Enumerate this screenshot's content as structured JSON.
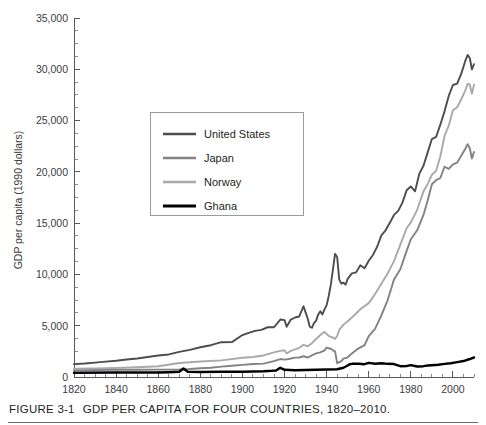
{
  "figure": {
    "caption_label": "FIGURE 3-1",
    "caption_title": "GDP PER CAPITA FOR FOUR COUNTRIES, 1820–2010."
  },
  "chart_data": {
    "type": "line",
    "title": "GDP PER CAPITA FOR FOUR COUNTRIES, 1820–2010.",
    "xlabel": "",
    "ylabel": "GDP per capita (1990 dollars)",
    "xlim": [
      1820,
      2010
    ],
    "ylim": [
      0,
      35000
    ],
    "grid": false,
    "legend_position": "upper-left-inside",
    "x_ticks": [
      1820,
      1840,
      1860,
      1880,
      1900,
      1920,
      1940,
      1960,
      1980,
      2000
    ],
    "x_tick_labels": [
      "1820",
      "1840",
      "1860",
      "1880",
      "1900",
      "1920",
      "1940",
      "1960",
      "1980",
      "2000"
    ],
    "x_minor_step": 5,
    "y_ticks": [
      0,
      5000,
      10000,
      15000,
      20000,
      25000,
      30000,
      35000
    ],
    "y_tick_labels": [
      "0",
      "5,000",
      "10,000",
      "15,000",
      "20,000",
      "25,000",
      "30,000",
      "35,000"
    ],
    "y_minor_step": 1250,
    "colors": {
      "united_states": "#4d4d4f",
      "japan": "#808285",
      "norway": "#a7a9ac",
      "ghana": "#000000"
    },
    "series": [
      {
        "name": "United States",
        "color": "#4d4d4f",
        "x": [
          1820,
          1825,
          1830,
          1835,
          1840,
          1845,
          1850,
          1855,
          1860,
          1865,
          1870,
          1875,
          1880,
          1885,
          1890,
          1895,
          1900,
          1903,
          1906,
          1909,
          1912,
          1915,
          1918,
          1920,
          1921,
          1923,
          1925,
          1927,
          1929,
          1930,
          1931,
          1932,
          1933,
          1934,
          1935,
          1936,
          1937,
          1938,
          1939,
          1940,
          1941,
          1942,
          1943,
          1944,
          1945,
          1946,
          1947,
          1948,
          1949,
          1950,
          1952,
          1954,
          1956,
          1958,
          1960,
          1962,
          1964,
          1966,
          1968,
          1970,
          1972,
          1974,
          1976,
          1978,
          1980,
          1982,
          1984,
          1986,
          1988,
          1990,
          1992,
          1994,
          1996,
          1998,
          2000,
          2002,
          2004,
          2006,
          2007,
          2008,
          2009,
          2010
        ],
        "y": [
          1257,
          1310,
          1400,
          1500,
          1588,
          1700,
          1806,
          1950,
          2100,
          2200,
          2445,
          2650,
          2900,
          3100,
          3392,
          3400,
          4091,
          4300,
          4500,
          4600,
          4850,
          4850,
          5600,
          5550,
          4900,
          5600,
          5800,
          5900,
          6899,
          6300,
          5700,
          4900,
          4800,
          5250,
          5500,
          6100,
          6400,
          6100,
          6600,
          7010,
          7900,
          9000,
          10500,
          12000,
          11700,
          9500,
          9100,
          9200,
          9000,
          9561,
          10100,
          10200,
          10900,
          10600,
          11328,
          11900,
          12700,
          13800,
          14300,
          15030,
          15800,
          16200,
          17000,
          18200,
          18577,
          18100,
          19800,
          20600,
          21900,
          23201,
          23400,
          24600,
          25900,
          27400,
          28467,
          28600,
          29600,
          30900,
          31400,
          31100,
          30000,
          30491
        ],
        "final_value": 30491
      },
      {
        "name": "Japan",
        "color": "#808285",
        "x": [
          1820,
          1830,
          1840,
          1850,
          1860,
          1870,
          1875,
          1880,
          1885,
          1890,
          1895,
          1900,
          1905,
          1910,
          1915,
          1918,
          1920,
          1922,
          1925,
          1927,
          1929,
          1931,
          1933,
          1935,
          1937,
          1939,
          1940,
          1941,
          1942,
          1943,
          1944,
          1945,
          1946,
          1947,
          1948,
          1950,
          1952,
          1955,
          1958,
          1960,
          1963,
          1966,
          1969,
          1972,
          1975,
          1978,
          1980,
          1983,
          1986,
          1988,
          1990,
          1992,
          1994,
          1996,
          1998,
          2000,
          2002,
          2004,
          2006,
          2007,
          2008,
          2009,
          2010
        ],
        "y": [
          669,
          680,
          690,
          704,
          720,
          737,
          780,
          850,
          900,
          1012,
          1100,
          1180,
          1270,
          1304,
          1550,
          1750,
          1696,
          1750,
          1885,
          1900,
          2026,
          1900,
          2100,
          2300,
          2400,
          2600,
          2874,
          2800,
          2750,
          2600,
          2500,
          1346,
          1450,
          1550,
          1800,
          1921,
          2300,
          2771,
          3100,
          3986,
          4700,
          6000,
          7500,
          9500,
          10500,
          12300,
          13428,
          14300,
          15800,
          17200,
          18789,
          19200,
          19400,
          20500,
          20300,
          20738,
          20900,
          21600,
          22300,
          22700,
          22300,
          21300,
          21935
        ],
        "final_value": 21935
      },
      {
        "name": "Norway",
        "color": "#a7a9ac",
        "x": [
          1820,
          1830,
          1840,
          1850,
          1860,
          1870,
          1880,
          1890,
          1900,
          1905,
          1910,
          1915,
          1918,
          1920,
          1921,
          1923,
          1925,
          1927,
          1929,
          1931,
          1933,
          1935,
          1937,
          1939,
          1940,
          1941,
          1942,
          1943,
          1944,
          1945,
          1946,
          1948,
          1950,
          1953,
          1956,
          1960,
          1963,
          1966,
          1969,
          1972,
          1975,
          1978,
          1980,
          1983,
          1986,
          1988,
          1990,
          1992,
          1994,
          1996,
          1998,
          2000,
          2002,
          2004,
          2006,
          2007,
          2008,
          2009,
          2010
        ],
        "y": [
          801,
          840,
          880,
          956,
          1049,
          1360,
          1517,
          1617,
          1877,
          1950,
          2100,
          2400,
          2550,
          2603,
          2300,
          2550,
          2700,
          2850,
          3133,
          3000,
          3300,
          3700,
          4100,
          4400,
          4200,
          4000,
          3900,
          3850,
          3700,
          4000,
          4600,
          5100,
          5430,
          6000,
          6600,
          7204,
          8100,
          9100,
          10100,
          11300,
          12900,
          14500,
          15076,
          16300,
          18100,
          18800,
          19720,
          20100,
          21500,
          23500,
          24500,
          26000,
          26300,
          27100,
          28000,
          28600,
          28500,
          27600,
          28500
        ],
        "final_value": 28500
      },
      {
        "name": "Ghana",
        "color": "#000000",
        "x": [
          1820,
          1840,
          1860,
          1865,
          1870,
          1872,
          1874,
          1880,
          1890,
          1900,
          1905,
          1910,
          1912,
          1914,
          1916,
          1918,
          1920,
          1925,
          1930,
          1935,
          1940,
          1945,
          1948,
          1950,
          1951,
          1952,
          1955,
          1958,
          1960,
          1963,
          1966,
          1969,
          1972,
          1975,
          1978,
          1980,
          1983,
          1986,
          1988,
          1990,
          1993,
          1996,
          1999,
          2002,
          2005,
          2008,
          2010
        ],
        "y": [
          420,
          430,
          440,
          470,
          520,
          820,
          520,
          480,
          500,
          520,
          540,
          560,
          580,
          600,
          640,
          900,
          700,
          650,
          680,
          700,
          720,
          760,
          900,
          1122,
          1250,
          1280,
          1300,
          1250,
          1378,
          1300,
          1350,
          1280,
          1260,
          1060,
          1080,
          1157,
          1020,
          1060,
          1110,
          1150,
          1200,
          1280,
          1350,
          1450,
          1550,
          1750,
          1900
        ],
        "final_value": 1900
      }
    ]
  },
  "legend": {
    "items": [
      {
        "label": "United States",
        "color": "#4d4d4f",
        "width": 2.6
      },
      {
        "label": "Japan",
        "color": "#808285",
        "width": 2.6
      },
      {
        "label": "Norway",
        "color": "#a7a9ac",
        "width": 2.6
      },
      {
        "label": "Ghana",
        "color": "#000000",
        "width": 3.0
      }
    ]
  }
}
